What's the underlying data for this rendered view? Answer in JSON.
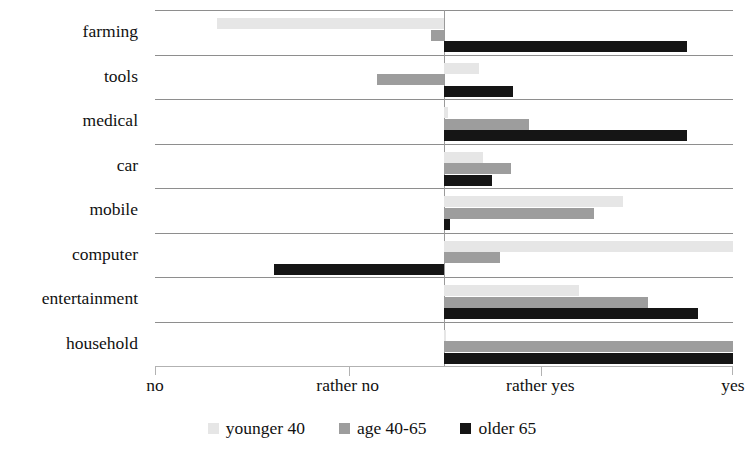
{
  "chart_data": {
    "type": "bar",
    "orientation": "horizontal",
    "title": "",
    "xlabel": "",
    "ylabel": "",
    "grid": true,
    "legend_position": "bottom-center",
    "xlim": [
      0,
      3
    ],
    "x_tick_values": [
      0,
      1,
      2,
      3
    ],
    "x_tick_labels": [
      "no",
      "rather no",
      "rather yes",
      "yes"
    ],
    "baseline_value": 1.5,
    "categories": [
      "farming",
      "tools",
      "medical",
      "car",
      "mobile",
      "computer",
      "entertainment",
      "household"
    ],
    "series": [
      {
        "name": "younger 40",
        "color": "#e6e6e6",
        "values": [
          0.32,
          1.68,
          1.52,
          1.7,
          2.43,
          3.25,
          2.2,
          1.51
        ]
      },
      {
        "name": "age 40-65",
        "color": "#9d9d9d",
        "values": [
          1.43,
          1.15,
          1.94,
          1.85,
          2.28,
          1.79,
          2.56,
          3.02
        ]
      },
      {
        "name": "older 65",
        "color": "#151515",
        "values": [
          2.76,
          1.86,
          2.76,
          1.75,
          1.53,
          0.62,
          2.82,
          3.41
        ]
      }
    ]
  },
  "legend": {
    "items": [
      {
        "label": "younger 40",
        "color": "#e6e6e6"
      },
      {
        "label": "age 40-65",
        "color": "#9d9d9d"
      },
      {
        "label": "older 65",
        "color": "#151515"
      }
    ]
  },
  "colors": {
    "younger_40": "#e6e6e6",
    "age_40_65": "#9d9d9d",
    "older_65": "#151515",
    "gridline": "#8e8e8e",
    "axis": "#b2b2b2",
    "background": "#ffffff",
    "text": "#111111"
  }
}
